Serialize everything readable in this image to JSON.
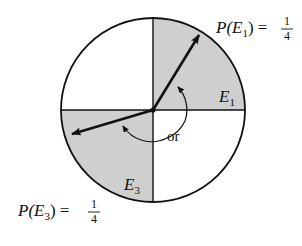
{
  "diagram": {
    "type": "spinner",
    "colors": {
      "shade": "#cfcfcf",
      "line": "#111111",
      "background": "#ffffff"
    },
    "regions": [
      {
        "id": "E1",
        "label": "E",
        "sub": "1",
        "quadrant": "upper-right",
        "shaded": true
      },
      {
        "id": "E3",
        "label": "E",
        "sub": "3",
        "quadrant": "lower-left",
        "shaded": true
      }
    ],
    "annotations": {
      "p1": {
        "prefix": "P(E",
        "sub": "1",
        "suffix": ") =",
        "num": "1",
        "den": "4"
      },
      "p3": {
        "prefix": "P(E",
        "sub": "3",
        "suffix": ") =",
        "num": "1",
        "den": "4"
      },
      "or_label": "or"
    }
  }
}
